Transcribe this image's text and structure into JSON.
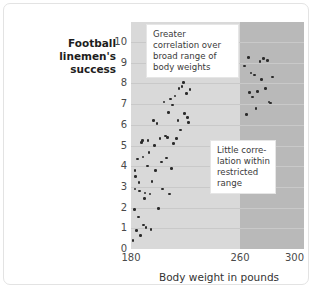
{
  "figure": {
    "y_axis_title": "Football linemen's success",
    "x_axis_title": "Body weight in pounds",
    "annotations": {
      "broad": "Greater correlation over broad range of body weights",
      "restricted": "Little corre-lation within restricted range"
    }
  },
  "chart_data": {
    "type": "scatter",
    "title": "",
    "xlabel": "Body weight in pounds",
    "ylabel": "Football linemen's success",
    "xlim": [
      180,
      307
    ],
    "ylim": [
      0,
      10
    ],
    "xticks": [
      180,
      260,
      300
    ],
    "yticks": [
      0,
      1,
      2,
      3,
      4,
      5,
      6,
      7,
      8,
      9,
      10
    ],
    "grid": "horizontal",
    "legend": "none",
    "shaded_regions": [
      {
        "name": "broad-range",
        "x_from": 180,
        "x_to": 260,
        "color": "#d9d9d9"
      },
      {
        "name": "restricted-range",
        "x_from": 260,
        "x_to": 307,
        "color": "#b9b9b9"
      }
    ],
    "annotations": [
      {
        "name": "broad-range-note",
        "text": "Greater correlation over broad range of body weights"
      },
      {
        "name": "restricted-range-note",
        "text": "Little corre-lation within restricted range"
      }
    ],
    "points": [
      [
        181.5,
        0.4
      ],
      [
        182.5,
        1.9
      ],
      [
        182.8,
        3.8
      ],
      [
        183.0,
        2.9
      ],
      [
        183.4,
        3.5
      ],
      [
        184.0,
        0.9
      ],
      [
        184.6,
        4.35
      ],
      [
        185.4,
        1.55
      ],
      [
        186.0,
        3.2
      ],
      [
        186.3,
        2.8
      ],
      [
        186.9,
        0.65
      ],
      [
        187.6,
        5.15
      ],
      [
        188.4,
        5.25
      ],
      [
        188.8,
        4.45
      ],
      [
        189.2,
        1.15
      ],
      [
        189.8,
        2.45
      ],
      [
        190.4,
        2.7
      ],
      [
        190.9,
        1.05
      ],
      [
        192.0,
        4.0
      ],
      [
        192.6,
        5.25
      ],
      [
        193.2,
        4.65
      ],
      [
        194.0,
        2.65
      ],
      [
        194.6,
        0.95
      ],
      [
        195.4,
        3.25
      ],
      [
        196.6,
        6.2
      ],
      [
        197.4,
        5.0
      ],
      [
        198.2,
        3.8
      ],
      [
        199.0,
        6.05
      ],
      [
        200.2,
        1.95
      ],
      [
        201.4,
        5.35
      ],
      [
        202.4,
        4.2
      ],
      [
        203.0,
        2.9
      ],
      [
        204.2,
        7.1
      ],
      [
        205.4,
        5.45
      ],
      [
        206.0,
        4.4
      ],
      [
        206.6,
        5.4
      ],
      [
        207.6,
        6.6
      ],
      [
        208.2,
        2.65
      ],
      [
        209.2,
        7.25
      ],
      [
        209.8,
        3.9
      ],
      [
        210.6,
        6.95
      ],
      [
        211.2,
        5.1
      ],
      [
        212.4,
        7.4
      ],
      [
        213.2,
        5.35
      ],
      [
        214.4,
        6.2
      ],
      [
        215.2,
        7.75
      ],
      [
        216.4,
        5.75
      ],
      [
        217.4,
        7.85
      ],
      [
        218.6,
        8.05
      ],
      [
        219.4,
        6.55
      ],
      [
        220.6,
        7.5
      ],
      [
        221.4,
        6.35
      ],
      [
        222.0,
        6.1
      ],
      [
        223.2,
        7.7
      ],
      [
        263.5,
        8.85
      ],
      [
        265.0,
        6.5
      ],
      [
        266.4,
        9.25
      ],
      [
        267.2,
        7.55
      ],
      [
        268.0,
        8.5
      ],
      [
        269.4,
        7.35
      ],
      [
        270.6,
        8.4
      ],
      [
        271.8,
        6.8
      ],
      [
        273.0,
        7.6
      ],
      [
        274.6,
        9.05
      ],
      [
        276.0,
        8.2
      ],
      [
        277.4,
        9.2
      ],
      [
        278.6,
        7.75
      ],
      [
        280.0,
        9.1
      ],
      [
        281.2,
        7.1
      ],
      [
        282.4,
        7.05
      ],
      [
        284.0,
        8.3
      ]
    ]
  }
}
